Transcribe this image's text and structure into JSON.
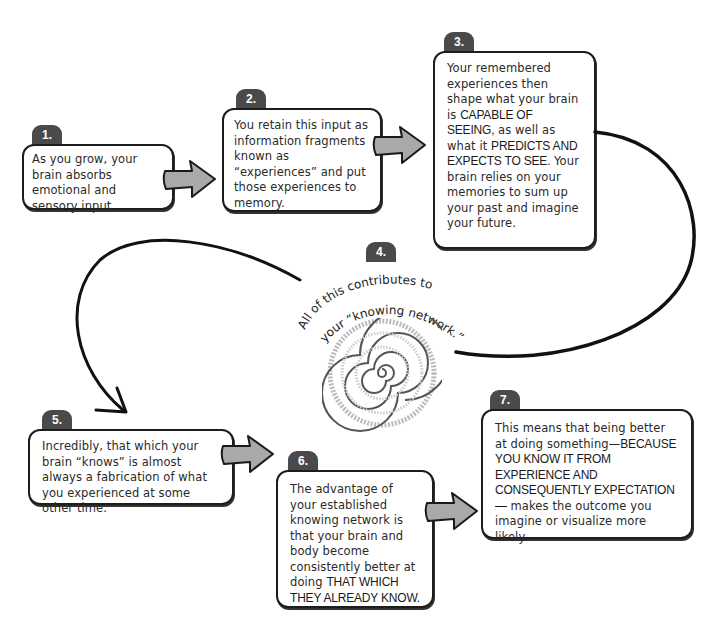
{
  "diagram": {
    "type": "flow",
    "steps": [
      {
        "number": "1.",
        "parts": [
          {
            "text": "As you grow, your brain absorbs emotional and sensory input.",
            "caps": false
          }
        ]
      },
      {
        "number": "2.",
        "parts": [
          {
            "text": "You retain this input as information fragments known as “experiences” and put those experiences to memory.",
            "caps": false
          }
        ]
      },
      {
        "number": "3.",
        "parts": [
          {
            "text": "Your remembered experiences then shape what your brain is ",
            "caps": false
          },
          {
            "text": "CAPABLE OF SEEING,",
            "caps": true
          },
          {
            "text": " as well as what it ",
            "caps": false
          },
          {
            "text": "PREDICTS AND EXPECTS TO SEE.",
            "caps": true
          },
          {
            "text": " Your brain relies on your memories to sum up your past and imagine your future.",
            "caps": false
          }
        ]
      },
      {
        "number": "4.",
        "parts": [
          {
            "text": "All of this contributes to your “knowing network.”",
            "caps": false
          }
        ],
        "spiral_word": "knowing"
      },
      {
        "number": "5.",
        "parts": [
          {
            "text": "Incredibly, that which your brain “knows” is almost always a fabrication of what you experienced at some other time.",
            "caps": false
          }
        ]
      },
      {
        "number": "6.",
        "parts": [
          {
            "text": "The advantage of your established knowing network is that your brain and body become consistently better at doing ",
            "caps": false
          },
          {
            "text": "THAT WHICH THEY ALREADY KNOW.",
            "caps": true
          }
        ]
      },
      {
        "number": "7.",
        "parts": [
          {
            "text": "This means that being better at doing something—",
            "caps": false
          },
          {
            "text": "BECAUSE YOU KNOW IT FROM EXPERIENCE AND CONSEQUENTLY EXPECTATION—",
            "caps": true
          },
          {
            "text": " makes the outcome you imagine or visualize more likely.",
            "caps": false
          }
        ]
      }
    ],
    "colors": {
      "badge": "#4a4a4a",
      "badge_text": "#ffffff",
      "box_border": "#1d1d1d",
      "arrow_fill": "#a9a9a9",
      "line": "#111111",
      "spiral": "#555555"
    }
  }
}
